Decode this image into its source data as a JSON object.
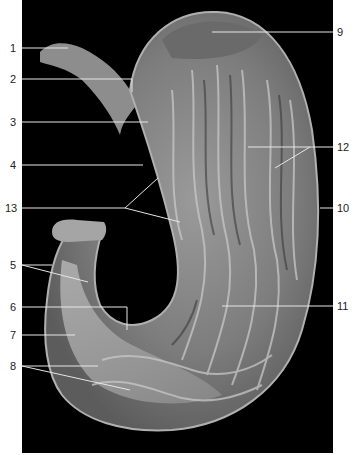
{
  "figure": {
    "labels_left": [
      {
        "num": "1",
        "y": 48
      },
      {
        "num": "2",
        "y": 79
      },
      {
        "num": "3",
        "y": 122
      },
      {
        "num": "4",
        "y": 165
      },
      {
        "num": "13",
        "y": 208
      },
      {
        "num": "5",
        "y": 265
      },
      {
        "num": "6",
        "y": 307
      },
      {
        "num": "7",
        "y": 335
      },
      {
        "num": "8",
        "y": 366
      }
    ],
    "labels_right": [
      {
        "num": "9",
        "y": 32
      },
      {
        "num": "12",
        "y": 147
      },
      {
        "num": "10",
        "y": 208
      },
      {
        "num": "11",
        "y": 306
      }
    ]
  }
}
